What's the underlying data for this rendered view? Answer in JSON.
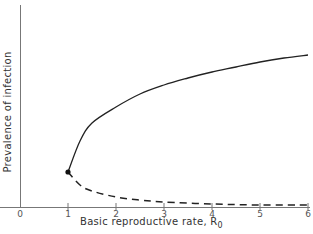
{
  "chart_data": {
    "type": "line",
    "title": "",
    "xlabel": "Basic reproductive rate, R",
    "xlabel_subscript": "0",
    "ylabel": "Prevalence of infection",
    "xlim": [
      0,
      6
    ],
    "ylim": [
      0,
      1
    ],
    "x_ticks": [
      "0",
      "1",
      "2",
      "3",
      "4",
      "5",
      "6"
    ],
    "y_ticks": [],
    "grid": false,
    "legend": null,
    "series": [
      {
        "name": "stable equilibrium",
        "style": "solid",
        "x": [
          1,
          1.25,
          1.5,
          2,
          2.5,
          3,
          3.5,
          4,
          4.5,
          5,
          5.5,
          6
        ],
        "y": [
          0.175,
          0.33,
          0.42,
          0.5,
          0.565,
          0.61,
          0.645,
          0.675,
          0.7,
          0.725,
          0.745,
          0.76
        ]
      },
      {
        "name": "unstable equilibrium",
        "style": "dashed",
        "x": [
          1,
          1.25,
          1.5,
          2,
          2.5,
          3,
          4,
          5,
          6
        ],
        "y": [
          0.175,
          0.11,
          0.08,
          0.05,
          0.035,
          0.025,
          0.015,
          0.01,
          0.01
        ]
      }
    ],
    "annotations": [
      {
        "type": "point",
        "x": 1,
        "y": 0.175,
        "label": "bifurcation point"
      }
    ]
  }
}
